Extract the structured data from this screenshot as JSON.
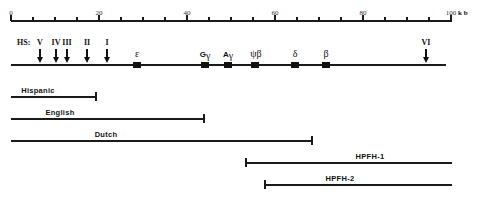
{
  "ruler": {
    "unit": "k b",
    "ticks": [
      {
        "label": "0"
      },
      {
        "label": ""
      },
      {
        "label": ""
      },
      {
        "label": ""
      },
      {
        "label": "20"
      },
      {
        "label": ""
      },
      {
        "label": ""
      },
      {
        "label": ""
      },
      {
        "label": "40"
      },
      {
        "label": ""
      },
      {
        "label": ""
      },
      {
        "label": ""
      },
      {
        "label": "60"
      },
      {
        "label": ""
      },
      {
        "label": ""
      },
      {
        "label": ""
      },
      {
        "label": "80"
      },
      {
        "label": ""
      },
      {
        "label": ""
      },
      {
        "label": ""
      },
      {
        "label": "100"
      }
    ]
  },
  "hypersensitive_sites": {
    "prefix": "HS:",
    "sites": [
      {
        "label": "V",
        "position_kb": 6.5
      },
      {
        "label": "IV",
        "position_kb": 10
      },
      {
        "label": "III",
        "position_kb": 12.5
      },
      {
        "label": "II",
        "position_kb": 17
      },
      {
        "label": "I",
        "position_kb": 21.5
      },
      {
        "label": "VI",
        "position_kb": 94.3
      }
    ]
  },
  "genes": [
    {
      "label": "ε",
      "position_kb": 29.3
    },
    {
      "label": "G",
      "sub": "γ",
      "position_kb": 44.8
    },
    {
      "label": "A",
      "sub": "γ",
      "position_kb": 50
    },
    {
      "label": "ψβ",
      "position_kb": 56.1
    },
    {
      "label": "δ",
      "position_kb": 65.2
    },
    {
      "label": "β",
      "position_kb": 72.3
    }
  ],
  "deletions": [
    {
      "label": "Hispanic",
      "start_kb": 0,
      "end_kb": 19.3
    },
    {
      "label": "English",
      "start_kb": 0,
      "end_kb": 43.9
    },
    {
      "label": "Dutch",
      "start_kb": 0,
      "end_kb": 68.4
    },
    {
      "label": "HPFH-1",
      "start_kb": 53.4,
      "end_kb": 100
    },
    {
      "label": "HPFH-2",
      "start_kb": 57.7,
      "end_kb": 100
    }
  ]
}
